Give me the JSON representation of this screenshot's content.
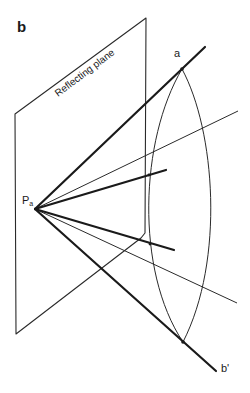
{
  "figure": {
    "panel_label": "b",
    "plane_label": "Reflecting plane",
    "point_source": {
      "label": "P",
      "subscript": "a"
    },
    "point_a": {
      "label": "a"
    },
    "point_b": {
      "label": "b'"
    }
  },
  "geometry": {
    "plane_polygon": [
      [
        15,
        114
      ],
      [
        146,
        18
      ],
      [
        145,
        232
      ],
      [
        16,
        334
      ]
    ],
    "source": [
      35,
      209
    ],
    "thick_rays": [
      {
        "name": "ray-to-a",
        "end": [
          205,
          47
        ]
      },
      {
        "name": "ray-upper-mid",
        "end": [
          166,
          170
        ]
      },
      {
        "name": "ray-lower-mid",
        "end": [
          174,
          250
        ]
      },
      {
        "name": "ray-to-b-prime",
        "end": [
          216,
          371
        ]
      }
    ],
    "thin_rays": [
      {
        "name": "thin-ray-upper",
        "end": [
          238,
          111
        ]
      },
      {
        "name": "thin-ray-lower",
        "end": [
          237,
          303
        ]
      }
    ],
    "arc_top": [
      182,
      69
    ],
    "arc_bottom": [
      183,
      342
    ],
    "colors": {
      "ink": "#1a1a1a",
      "background": "#ffffff"
    }
  }
}
